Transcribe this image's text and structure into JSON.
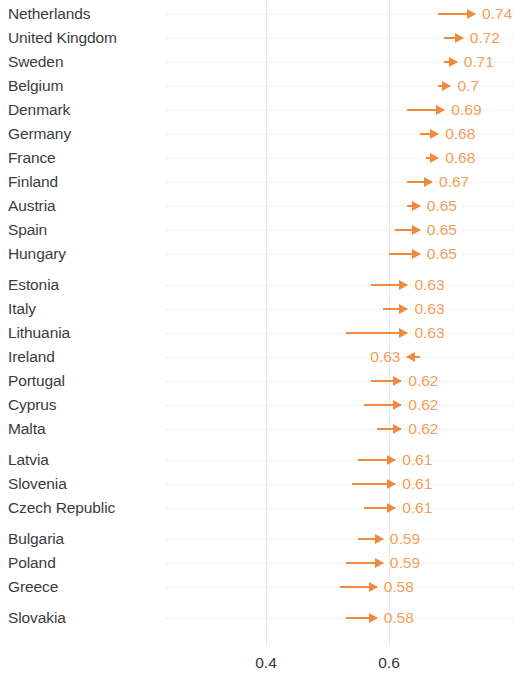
{
  "chart_data": {
    "type": "bar",
    "subtype": "arrow-change-chart",
    "title": "",
    "subtitle": "",
    "xlabel": "",
    "ylabel": "",
    "xlim": [
      0.35,
      0.79
    ],
    "xticks": [
      0.4,
      0.6
    ],
    "xticklabels": [
      "0.4",
      "0.6"
    ],
    "grid": true,
    "legend": null,
    "orientation": "horizontal",
    "accent_color": "#F08A3C",
    "value_label_color": "#F2A05A",
    "category_label_color": "#3B3B3F",
    "gridline_color": "#E9E9EE",
    "categories": [
      "Netherlands",
      "United Kingdom",
      "Sweden",
      "Belgium",
      "Denmark",
      "Germany",
      "France",
      "Finland",
      "Austria",
      "Spain",
      "Hungary",
      "Estonia",
      "Italy",
      "Lithuania",
      "Ireland",
      "Portugal",
      "Cyprus",
      "Malta",
      "Latvia",
      "Slovenia",
      "Czech Republic",
      "Bulgaria",
      "Poland",
      "Greece",
      "Slovakia"
    ],
    "series": [
      {
        "name": "start",
        "values": [
          0.68,
          0.69,
          0.69,
          0.68,
          0.63,
          0.65,
          0.66,
          0.63,
          0.63,
          0.61,
          0.6,
          0.57,
          0.59,
          0.53,
          0.65,
          0.57,
          0.56,
          0.58,
          0.55,
          0.54,
          0.56,
          0.55,
          0.53,
          0.52,
          0.53
        ]
      },
      {
        "name": "end",
        "values": [
          0.74,
          0.72,
          0.71,
          0.7,
          0.69,
          0.68,
          0.68,
          0.67,
          0.65,
          0.65,
          0.65,
          0.63,
          0.63,
          0.63,
          0.63,
          0.62,
          0.62,
          0.62,
          0.61,
          0.61,
          0.61,
          0.59,
          0.59,
          0.58,
          0.58
        ]
      }
    ],
    "rows": [
      {
        "label": "Netherlands",
        "start": 0.68,
        "end": 0.74,
        "value_text": "0.74",
        "direction": "right",
        "group": 0
      },
      {
        "label": "United Kingdom",
        "start": 0.69,
        "end": 0.72,
        "value_text": "0.72",
        "direction": "right",
        "group": 0
      },
      {
        "label": "Sweden",
        "start": 0.69,
        "end": 0.71,
        "value_text": "0.71",
        "direction": "right",
        "group": 0
      },
      {
        "label": "Belgium",
        "start": 0.68,
        "end": 0.7,
        "value_text": "0.7",
        "direction": "right",
        "group": 0
      },
      {
        "label": "Denmark",
        "start": 0.63,
        "end": 0.69,
        "value_text": "0.69",
        "direction": "right",
        "group": 0
      },
      {
        "label": "Germany",
        "start": 0.65,
        "end": 0.68,
        "value_text": "0.68",
        "direction": "right",
        "group": 0
      },
      {
        "label": "France",
        "start": 0.66,
        "end": 0.68,
        "value_text": "0.68",
        "direction": "right",
        "group": 0
      },
      {
        "label": "Finland",
        "start": 0.63,
        "end": 0.67,
        "value_text": "0.67",
        "direction": "right",
        "group": 0
      },
      {
        "label": "Austria",
        "start": 0.63,
        "end": 0.65,
        "value_text": "0.65",
        "direction": "right",
        "group": 0
      },
      {
        "label": "Spain",
        "start": 0.61,
        "end": 0.65,
        "value_text": "0.65",
        "direction": "right",
        "group": 0
      },
      {
        "label": "Hungary",
        "start": 0.6,
        "end": 0.65,
        "value_text": "0.65",
        "direction": "right",
        "group": 0
      },
      {
        "label": "Estonia",
        "start": 0.57,
        "end": 0.63,
        "value_text": "0.63",
        "direction": "right",
        "group": 1
      },
      {
        "label": "Italy",
        "start": 0.59,
        "end": 0.63,
        "value_text": "0.63",
        "direction": "right",
        "group": 1
      },
      {
        "label": "Lithuania",
        "start": 0.53,
        "end": 0.63,
        "value_text": "0.63",
        "direction": "right",
        "group": 1
      },
      {
        "label": "Ireland",
        "start": 0.65,
        "end": 0.63,
        "value_text": "0.63",
        "direction": "left",
        "group": 1
      },
      {
        "label": "Portugal",
        "start": 0.57,
        "end": 0.62,
        "value_text": "0.62",
        "direction": "right",
        "group": 1
      },
      {
        "label": "Cyprus",
        "start": 0.56,
        "end": 0.62,
        "value_text": "0.62",
        "direction": "right",
        "group": 1
      },
      {
        "label": "Malta",
        "start": 0.58,
        "end": 0.62,
        "value_text": "0.62",
        "direction": "right",
        "group": 1
      },
      {
        "label": "Latvia",
        "start": 0.55,
        "end": 0.61,
        "value_text": "0.61",
        "direction": "right",
        "group": 2
      },
      {
        "label": "Slovenia",
        "start": 0.54,
        "end": 0.61,
        "value_text": "0.61",
        "direction": "right",
        "group": 2
      },
      {
        "label": "Czech Republic",
        "start": 0.56,
        "end": 0.61,
        "value_text": "0.61",
        "direction": "right",
        "group": 2
      },
      {
        "label": "Bulgaria",
        "start": 0.55,
        "end": 0.59,
        "value_text": "0.59",
        "direction": "right",
        "group": 3
      },
      {
        "label": "Poland",
        "start": 0.53,
        "end": 0.59,
        "value_text": "0.59",
        "direction": "right",
        "group": 3
      },
      {
        "label": "Greece",
        "start": 0.52,
        "end": 0.58,
        "value_text": "0.58",
        "direction": "right",
        "group": 3
      },
      {
        "label": "Slovakia",
        "start": 0.53,
        "end": 0.58,
        "value_text": "0.58",
        "direction": "right",
        "group": 4
      }
    ]
  },
  "axis": {
    "ticks": [
      {
        "value": 0.4,
        "label": "0.4"
      },
      {
        "value": 0.6,
        "label": "0.6"
      }
    ]
  }
}
